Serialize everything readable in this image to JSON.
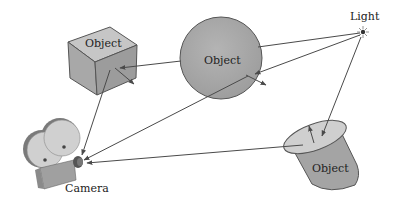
{
  "diagram": {
    "colors": {
      "background": "#ffffff",
      "object_fill": "#a9a9a9",
      "object_top": "#c8c8c8",
      "outline": "#555555",
      "ray": "#4a4a4a",
      "text": "#222222"
    },
    "nodes": [
      {
        "id": "cube",
        "label": "Object",
        "shape": "cube"
      },
      {
        "id": "sphere",
        "label": "Object",
        "shape": "sphere"
      },
      {
        "id": "cylinder",
        "label": "Object",
        "shape": "cylinder"
      },
      {
        "id": "light",
        "label": "Light",
        "icon": "light-source-icon"
      },
      {
        "id": "camera",
        "label": "Camera",
        "icon": "movie-camera-icon"
      }
    ],
    "edges": [
      {
        "from": "light",
        "to": "sphere",
        "kind": "ray"
      },
      {
        "from": "light",
        "to": "sphere",
        "kind": "ray"
      },
      {
        "from": "light",
        "to": "cylinder",
        "kind": "ray"
      },
      {
        "from": "sphere",
        "to": "cube",
        "kind": "ray"
      },
      {
        "from": "sphere",
        "to": "camera",
        "kind": "ray"
      },
      {
        "from": "cube",
        "to": "camera",
        "kind": "ray"
      },
      {
        "from": "cylinder",
        "to": "camera",
        "kind": "ray"
      }
    ],
    "labels": {
      "cube": "Object",
      "sphere": "Object",
      "cylinder": "Object",
      "light": "Light",
      "camera": "Camera"
    }
  }
}
